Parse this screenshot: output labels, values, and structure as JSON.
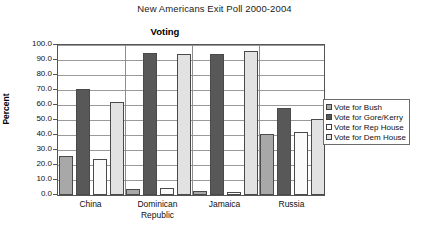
{
  "super_title": "New Americans Exit Poll 2000-2004",
  "legend": {
    "position": "right-inside",
    "entries": [
      {
        "label": "Vote for Bush",
        "color": "#a8a8a8"
      },
      {
        "label": "Vote for Gore/Kerry",
        "color": "#585858"
      },
      {
        "label": "Vote for Rep House",
        "color": "#fbfbfb"
      },
      {
        "label": "Vote for Dem House",
        "color": "#e2e2e2"
      }
    ]
  },
  "chart_data": {
    "type": "bar",
    "title": "Voting",
    "xlabel": "",
    "ylabel": "Percent",
    "ylim": [
      0.0,
      100.0
    ],
    "ytick_step": 10.0,
    "ytick_labels": [
      "100.0",
      "90.0",
      "80.0",
      "70.0",
      "60.0",
      "50.0",
      "40.0",
      "30.0",
      "20.0",
      "10.0",
      "0.0"
    ],
    "grid": true,
    "categories": [
      "China",
      "Dominican Republic",
      "Jamaica",
      "Russia"
    ],
    "category_lines": [
      [
        "China"
      ],
      [
        "Dominican",
        "Republic"
      ],
      [
        "Jamaica"
      ],
      [
        "Russia"
      ]
    ],
    "series": [
      {
        "name": "Vote for Bush",
        "color": "#a8a8a8",
        "values": [
          26.0,
          4.0,
          3.0,
          41.0
        ]
      },
      {
        "name": "Vote for Gore/Kerry",
        "color": "#585858",
        "values": [
          71.0,
          95.0,
          94.0,
          58.0
        ]
      },
      {
        "name": "Vote for Rep House",
        "color": "#fbfbfb",
        "values": [
          24.0,
          5.0,
          2.0,
          42.0
        ]
      },
      {
        "name": "Vote for Dem House",
        "color": "#e2e2e2",
        "values": [
          62.0,
          94.0,
          96.0,
          51.0
        ]
      }
    ]
  }
}
